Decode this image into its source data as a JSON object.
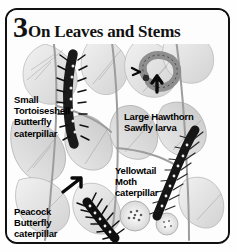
{
  "page": {
    "section_number": "3",
    "section_title": "On Leaves and Stems",
    "background_color": "#fdfdfd",
    "border_color": "#111111",
    "text_color": "#000000"
  },
  "labels": [
    {
      "id": "small-tortoiseshell",
      "text": "Small\nTortoiseshell\nButterfly\ncaterpillar"
    },
    {
      "id": "large-hawthorn-sawfly",
      "text": "Large Hawthorn\nSawfly larva"
    },
    {
      "id": "yellowtail-moth",
      "text": "Yellowtail\nMoth\ncaterpillar"
    },
    {
      "id": "peacock-butterfly",
      "text": "Peacock\nButterfly\ncaterpillar"
    }
  ],
  "illustration": {
    "description": "Grayscale engraving of stinging nettle leaves and stems with four insect larvae",
    "subjects": [
      "small tortoiseshell butterfly caterpillar",
      "large hawthorn sawfly larva",
      "yellowtail moth caterpillar",
      "peacock butterfly caterpillar"
    ]
  }
}
